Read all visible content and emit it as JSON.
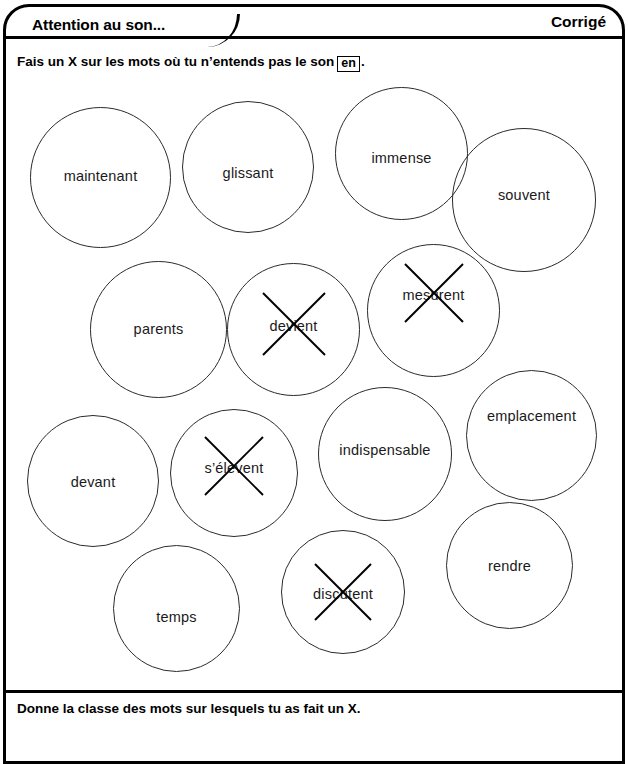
{
  "header": {
    "title": "Attention au son...",
    "corrige_label": "Corrigé"
  },
  "instruction": {
    "text_before": "Fais un X sur les mots où tu n’entends pas le son",
    "sound_box": "en",
    "text_after": "."
  },
  "footer": {
    "text": "Donne la classe des mots sur lesquels tu as fait un X."
  },
  "bubbles": [
    {
      "word": "maintenant",
      "crossed": false,
      "left": 30,
      "top": 107,
      "size": 141,
      "word_dy": 68,
      "cross_size": 0
    },
    {
      "word": "glissant",
      "crossed": false,
      "left": 182,
      "top": 101,
      "size": 132,
      "word_dy": 71,
      "cross_size": 0
    },
    {
      "word": "immense",
      "crossed": false,
      "left": 335,
      "top": 87,
      "size": 133,
      "word_dy": 70,
      "cross_size": 0
    },
    {
      "word": "souvent",
      "crossed": false,
      "left": 452,
      "top": 128,
      "size": 144,
      "word_dy": 66,
      "cross_size": 0
    },
    {
      "word": "parents",
      "crossed": false,
      "left": 90,
      "top": 261,
      "size": 137,
      "word_dy": 67,
      "cross_size": 0
    },
    {
      "word": "devient",
      "crossed": true,
      "left": 227,
      "top": 263,
      "size": 133,
      "word_dy": 62,
      "cross_size": 66
    },
    {
      "word": "mesurent",
      "crossed": true,
      "left": 367,
      "top": 244,
      "size": 133,
      "word_dy": 50,
      "cross_size": 62
    },
    {
      "word": "devant",
      "crossed": false,
      "left": 27,
      "top": 415,
      "size": 132,
      "word_dy": 66,
      "cross_size": 0
    },
    {
      "word": "s’élèvent",
      "crossed": true,
      "left": 170,
      "top": 409,
      "size": 128,
      "word_dy": 58,
      "cross_size": 62
    },
    {
      "word": "indispensable",
      "crossed": false,
      "left": 318,
      "top": 387,
      "size": 134,
      "word_dy": 62,
      "cross_size": 0
    },
    {
      "word": "emplacement",
      "crossed": false,
      "left": 466,
      "top": 370,
      "size": 131,
      "word_dy": 45,
      "cross_size": 0
    },
    {
      "word": "temps",
      "crossed": false,
      "left": 113,
      "top": 545,
      "size": 127,
      "word_dy": 71,
      "cross_size": 0
    },
    {
      "word": "discutent",
      "crossed": true,
      "left": 281,
      "top": 530,
      "size": 124,
      "word_dy": 63,
      "cross_size": 60
    },
    {
      "word": "rendre",
      "crossed": false,
      "left": 446,
      "top": 502,
      "size": 127,
      "word_dy": 63,
      "cross_size": 0
    }
  ]
}
